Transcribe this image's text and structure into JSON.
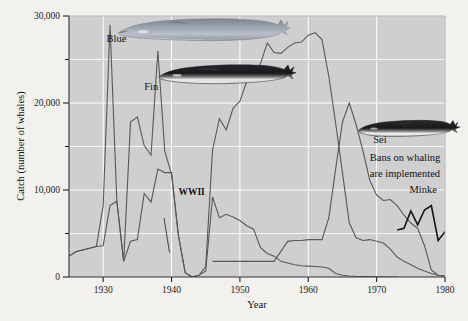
{
  "chart_data": {
    "type": "line",
    "title": "",
    "xlabel": "Year",
    "ylabel": "Catch (number of whales)",
    "xlim": [
      1925,
      1980
    ],
    "ylim": [
      0,
      30000
    ],
    "xticks": [
      1930,
      1940,
      1950,
      1960,
      1970,
      1980
    ],
    "xtick_labels": [
      "1930",
      "1940",
      "1950",
      "1960",
      "1970",
      "1980"
    ],
    "yticks": [
      0,
      5000,
      10000,
      15000,
      20000,
      25000,
      30000
    ],
    "ytick_labels": [
      "0",
      "",
      "10,000",
      "",
      "20,000",
      "",
      "30,000"
    ],
    "ytick_major_labels": [
      "0",
      "10,000",
      "20,000",
      "30,000"
    ],
    "grid": true,
    "legend_position": "inline-labels",
    "plot_background": "#cfcfcf",
    "gridline_color": "#ffffff",
    "line_color": "#585858",
    "minke_color": "#141414",
    "series": [
      {
        "name": "Blue",
        "color": "#585858",
        "x": [
          1925,
          1926,
          1927,
          1928,
          1929,
          1930,
          1931,
          1932,
          1933,
          1934,
          1935,
          1936,
          1937,
          1938,
          1939,
          1940,
          1941,
          1942,
          1943,
          1944,
          1945,
          1946,
          1947,
          1948,
          1949,
          1950,
          1951,
          1952,
          1953,
          1954,
          1955,
          1956,
          1957,
          1958,
          1959,
          1960,
          1961,
          1962,
          1963,
          1964,
          1965,
          1966,
          1967,
          1968,
          1969,
          1970,
          1971,
          1972,
          1973
        ],
        "values": [
          2400,
          2900,
          3100,
          3300,
          3500,
          8200,
          29000,
          8700,
          1800,
          17800,
          18400,
          15100,
          14000,
          26000,
          14500,
          11800,
          4800,
          500,
          0,
          200,
          700,
          9200,
          6800,
          7200,
          6900,
          6500,
          5900,
          5500,
          3400,
          2700,
          2400,
          1800,
          1600,
          1400,
          1300,
          1250,
          1200,
          1150,
          1000,
          400,
          200,
          120,
          80,
          60,
          40,
          20,
          10,
          5,
          0
        ]
      },
      {
        "name": "Fin",
        "color": "#585858",
        "x": [
          1925,
          1926,
          1927,
          1928,
          1929,
          1930,
          1931,
          1932,
          1933,
          1934,
          1935,
          1936,
          1937,
          1938,
          1939,
          1940,
          1941,
          1942,
          1943,
          1944,
          1945,
          1946,
          1947,
          1948,
          1949,
          1950,
          1951,
          1952,
          1953,
          1954,
          1955,
          1956,
          1957,
          1958,
          1959,
          1960,
          1961,
          1962,
          1963,
          1964,
          1965,
          1966,
          1967,
          1968,
          1969,
          1970,
          1971,
          1972,
          1973,
          1974,
          1975,
          1976,
          1977,
          1978,
          1979,
          1980
        ],
        "values": [
          2400,
          2900,
          3100,
          3300,
          3500,
          3600,
          8200,
          8700,
          1800,
          4100,
          4300,
          9600,
          8600,
          12400,
          12000,
          12000,
          4800,
          500,
          0,
          200,
          1200,
          14600,
          18200,
          16900,
          19400,
          20200,
          22500,
          23000,
          24500,
          26900,
          25800,
          25700,
          26400,
          26900,
          27000,
          27800,
          28100,
          27300,
          23100,
          17700,
          12000,
          6200,
          4500,
          4200,
          4300,
          4100,
          3900,
          3200,
          2300,
          1800,
          1400,
          1000,
          700,
          400,
          200,
          100
        ]
      },
      {
        "name": "Sei",
        "color": "#585858",
        "x": [
          1946,
          1950,
          1955,
          1957,
          1958,
          1959,
          1960,
          1961,
          1962,
          1963,
          1964,
          1965,
          1966,
          1967,
          1968,
          1969,
          1970,
          1971,
          1972,
          1973,
          1974,
          1975,
          1976,
          1977,
          1978,
          1979,
          1980
        ],
        "values": [
          1800,
          1800,
          1800,
          4100,
          4200,
          4200,
          4300,
          4300,
          4300,
          6800,
          12400,
          17800,
          20000,
          17500,
          14500,
          11100,
          9400,
          8800,
          8900,
          8200,
          7100,
          6200,
          5600,
          3600,
          800,
          200,
          100
        ]
      },
      {
        "name": "Minke",
        "color": "#141414",
        "x": [
          1973,
          1974,
          1975,
          1976,
          1977,
          1978,
          1979,
          1980
        ],
        "values": [
          5400,
          5600,
          7600,
          6000,
          7700,
          8200,
          4200,
          5200
        ]
      }
    ],
    "annotations": [
      {
        "name": "blue-label",
        "text": "Blue",
        "x": 1930.5,
        "y": 27000
      },
      {
        "name": "fin-label",
        "text": "Fin",
        "x": 1936.0,
        "y": 21500
      },
      {
        "name": "sei-label",
        "text": "Sei",
        "x": 1969.5,
        "y": 15400
      },
      {
        "name": "minke-label",
        "text": "Minke",
        "x": 1974.8,
        "y": 9700
      },
      {
        "name": "wwii-label",
        "text": "WWII",
        "x": 1941.0,
        "y": 9400
      },
      {
        "name": "bans-annotation-line1",
        "text": "Bans on whaling",
        "x": 1969.0,
        "y": 13300
      },
      {
        "name": "bans-annotation-line2",
        "text": "are implemented",
        "x": 1969.0,
        "y": 11500
      }
    ],
    "illustrations": [
      {
        "name": "blue-whale-illustration",
        "label": "Blue"
      },
      {
        "name": "fin-whale-illustration",
        "label": "Fin"
      },
      {
        "name": "sei-whale-illustration",
        "label": "Sei"
      }
    ]
  }
}
